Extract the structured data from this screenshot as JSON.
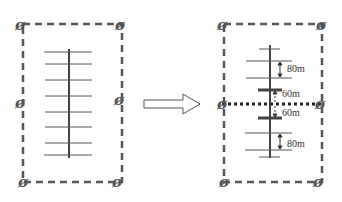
{
  "diagram": {
    "colors": {
      "boundary": "#555555",
      "line": "#444444",
      "thin_rung": "#555555",
      "dotted": "#222222",
      "arrow": "#555555"
    },
    "pile_symbol": "ø",
    "left": {
      "name": "original-layout",
      "rung_count": 8
    },
    "arrow": {
      "name": "transform-arrow"
    },
    "right": {
      "name": "modified-layout",
      "labels": {
        "top_spacing": "80m",
        "upper_center": "60m",
        "lower_center": "60m",
        "bottom_spacing": "80m"
      }
    }
  }
}
